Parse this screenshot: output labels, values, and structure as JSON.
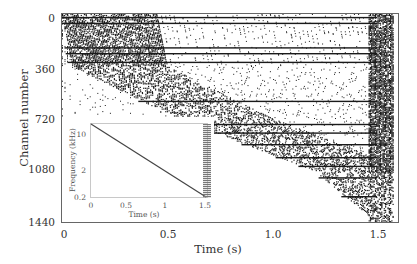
{
  "chart_data": {
    "type": "scatter",
    "subtype": "raster_plot",
    "title": "",
    "xlabel": "Time (s)",
    "ylabel": "Channel number",
    "xlim": [
      0,
      1.6
    ],
    "ylim": [
      1440,
      0
    ],
    "xticks": [
      "0",
      "0.5",
      "1.0",
      "1.5"
    ],
    "yticks": [
      "0",
      "360",
      "720",
      "1080",
      "1440"
    ],
    "grid": false,
    "sustained_channels": [
      20,
      60,
      230,
      270,
      330,
      600,
      760,
      820,
      900,
      990,
      1050,
      1130,
      1260
    ],
    "response_onset": [
      {
        "channel": 0,
        "time": 0.0
      },
      {
        "channel": 360,
        "time": 0.05
      },
      {
        "channel": 720,
        "time": 0.55
      },
      {
        "channel": 1080,
        "time": 1.2
      },
      {
        "channel": 1440,
        "time": 1.5
      }
    ],
    "inset": {
      "type": "line",
      "xlabel": "Time (s)",
      "ylabel": "Frequency (kHz)",
      "xticks": [
        "0",
        "0.5",
        "1",
        "1.5"
      ],
      "yticks": [
        "10",
        "2",
        "0.2"
      ],
      "yscale": "log",
      "xlim": [
        0,
        1.5
      ],
      "ylim": [
        0.2,
        20
      ],
      "series": [
        {
          "name": "sweep",
          "x": [
            0,
            1.5
          ],
          "y": [
            20,
            0.2
          ]
        }
      ]
    }
  },
  "colors": {
    "ink": "#1a1a1a",
    "axis": "#444444",
    "inset_axis": "#bbbbbb"
  }
}
